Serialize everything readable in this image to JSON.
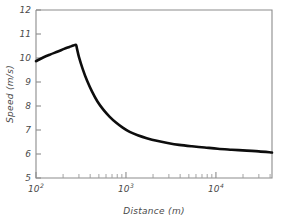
{
  "chart_data": {
    "type": "line",
    "title": "",
    "xlabel": "Distance (m)",
    "ylabel": "Speed (m/s)",
    "xscale": "log",
    "yscale": "linear",
    "xlim": [
      100,
      42000
    ],
    "ylim": [
      5,
      12
    ],
    "grid": false,
    "legend": null,
    "y_ticks": [
      5,
      6,
      7,
      8,
      9,
      10,
      11,
      12
    ],
    "y_tick_labels": [
      "5",
      "6",
      "7",
      "8",
      "9",
      "10",
      "11",
      "12"
    ],
    "x_ticks": [
      100,
      1000,
      10000
    ],
    "x_tick_labels": [
      "10",
      "10",
      "10"
    ],
    "x_tick_exponents": [
      "2",
      "3",
      "4"
    ],
    "x_minor_ticks": [
      200,
      300,
      400,
      500,
      600,
      700,
      800,
      900,
      2000,
      3000,
      4000,
      5000,
      6000,
      7000,
      8000,
      9000,
      20000,
      30000,
      40000
    ],
    "series": [
      {
        "name": "speed",
        "color": "#0d0d0d",
        "x": [
          100,
          120,
          145,
          175,
          205,
          235,
          260,
          278,
          285,
          300,
          330,
          370,
          420,
          480,
          560,
          660,
          780,
          920,
          1100,
          1350,
          1700,
          2200,
          2900,
          3900,
          5400,
          7500,
          10500,
          15000,
          22000,
          30000,
          42000
        ],
        "y": [
          9.87,
          10.02,
          10.15,
          10.27,
          10.38,
          10.46,
          10.52,
          10.55,
          10.4,
          10.05,
          9.55,
          9.05,
          8.6,
          8.2,
          7.85,
          7.55,
          7.3,
          7.1,
          6.92,
          6.78,
          6.66,
          6.55,
          6.46,
          6.38,
          6.32,
          6.27,
          6.22,
          6.18,
          6.14,
          6.11,
          6.06
        ]
      }
    ]
  },
  "axis_labels": {
    "x_title": "Distance (m)",
    "y_title": "Speed (m/s)"
  }
}
